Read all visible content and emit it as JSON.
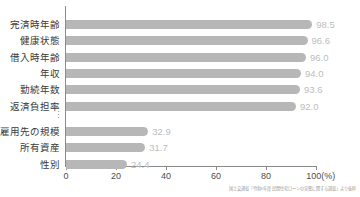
{
  "chart_data": {
    "type": "bar",
    "orientation": "horizontal",
    "title": "",
    "xlabel": "(%)",
    "ylabel": "",
    "xlim": [
      0,
      100
    ],
    "xticks": [
      0,
      20,
      40,
      60,
      80,
      100
    ],
    "xtick_labels": [
      "0",
      "20",
      "40",
      "60",
      "80",
      "100"
    ],
    "x_unit_label": "(%)",
    "grid": false,
    "legend": null,
    "categories": [
      "完済時年齢",
      "健康状態",
      "借入時年齢",
      "年収",
      "勤続年数",
      "返済負担率",
      "雇用先の規模",
      "所有資産",
      "性別"
    ],
    "values": [
      98.5,
      96.6,
      96.0,
      94.0,
      93.6,
      92.0,
      32.9,
      31.7,
      24.4
    ],
    "value_labels": [
      "98.5",
      "96.6",
      "96.0",
      "94.0",
      "93.6",
      "92.0",
      "32.9",
      "31.7",
      "24.4"
    ],
    "break_after_index": 5,
    "break_marker": "⋮",
    "bar_color": "#b7b7b7",
    "value_label_color": "#bdbdbd",
    "axis_color": "#8a8a8a"
  },
  "caption": {
    "text": "国土交通省「令和5年度 民間住宅ローンの実態に関する調査」より抜粋"
  }
}
